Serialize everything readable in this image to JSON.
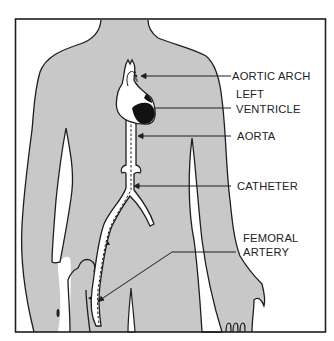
{
  "figure": {
    "colors": {
      "body_fill": "#c8c8c8",
      "outline": "#1e1e1e",
      "vessel_fill": "#ffffff",
      "heart_dark": "#111111",
      "background": "#ffffff"
    },
    "labels": [
      {
        "id": "aortic-arch",
        "lines": [
          "AORTIC ARCH"
        ]
      },
      {
        "id": "left-ventricle",
        "lines": [
          "LEFT",
          "VENTRICLE"
        ]
      },
      {
        "id": "aorta",
        "lines": [
          "AORTA"
        ]
      },
      {
        "id": "catheter",
        "lines": [
          "CATHETER"
        ]
      },
      {
        "id": "femoral-artery",
        "lines": [
          "FEMORAL",
          "ARTERY"
        ]
      }
    ]
  }
}
